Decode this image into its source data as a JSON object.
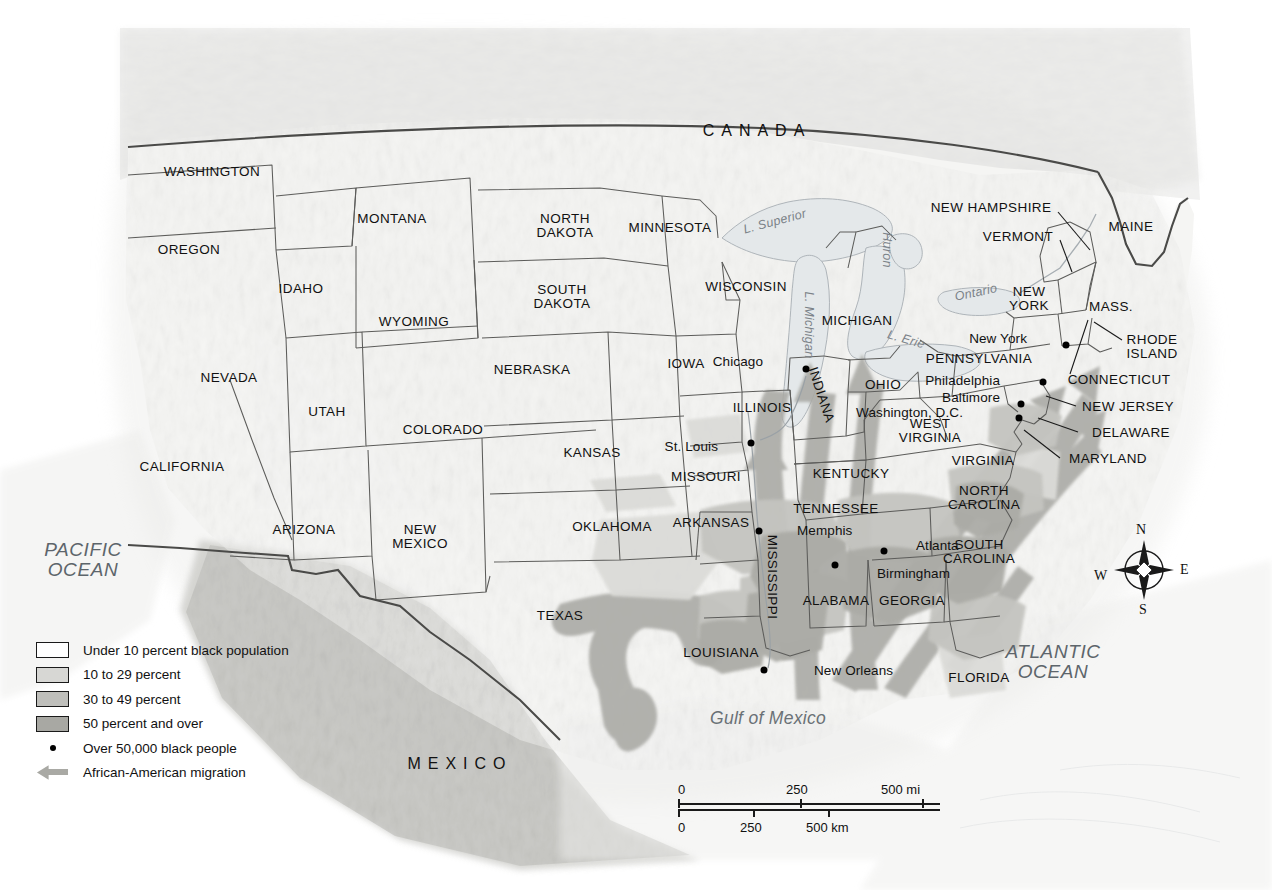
{
  "map": {
    "title_visible": false,
    "countries": [
      {
        "name": "CANADA",
        "x": 757,
        "y": 131
      },
      {
        "name": "MEXICO",
        "x": 460,
        "y": 764
      }
    ],
    "oceans": [
      {
        "name": "PACIFIC OCEAN",
        "lines": [
          "PACIFIC",
          "OCEAN"
        ],
        "x": 83,
        "y": 560
      },
      {
        "name": "ATLANTIC OCEAN",
        "lines": [
          "ATLANTIC",
          "OCEAN"
        ],
        "x": 1053,
        "y": 662
      }
    ],
    "water_bodies": [
      {
        "name": "Gulf of Mexico",
        "x": 768,
        "y": 718
      },
      {
        "name": "L. Superior",
        "x": 775,
        "y": 222
      },
      {
        "name": "Huron",
        "x": 886,
        "y": 250
      },
      {
        "name": "Ontario",
        "x": 976,
        "y": 293
      },
      {
        "name": "L. Erie",
        "x": 906,
        "y": 340
      },
      {
        "name": "L. Michigan",
        "x": 808,
        "y": 325
      }
    ],
    "states": [
      {
        "name": "WASHINGTON",
        "lines": [
          "WASHINGTON"
        ],
        "x": 212,
        "y": 172
      },
      {
        "name": "OREGON",
        "lines": [
          "OREGON"
        ],
        "x": 189,
        "y": 250
      },
      {
        "name": "IDAHO",
        "lines": [
          "IDAHO"
        ],
        "x": 301,
        "y": 289
      },
      {
        "name": "MONTANA",
        "lines": [
          "MONTANA"
        ],
        "x": 392,
        "y": 219
      },
      {
        "name": "WYOMING",
        "lines": [
          "WYOMING"
        ],
        "x": 414,
        "y": 322
      },
      {
        "name": "NEVADA",
        "lines": [
          "NEVADA"
        ],
        "x": 229,
        "y": 378
      },
      {
        "name": "UTAH",
        "lines": [
          "UTAH"
        ],
        "x": 327,
        "y": 412
      },
      {
        "name": "COLORADO",
        "lines": [
          "COLORADO"
        ],
        "x": 443,
        "y": 430
      },
      {
        "name": "CALIFORNIA",
        "lines": [
          "CALIFORNIA"
        ],
        "x": 182,
        "y": 467
      },
      {
        "name": "ARIZONA",
        "lines": [
          "ARIZONA"
        ],
        "x": 304,
        "y": 530
      },
      {
        "name": "NEW MEXICO",
        "lines": [
          "NEW",
          "MEXICO"
        ],
        "x": 420,
        "y": 537
      },
      {
        "name": "NORTH DAKOTA",
        "lines": [
          "NORTH",
          "DAKOTA"
        ],
        "x": 565,
        "y": 226
      },
      {
        "name": "SOUTH DAKOTA",
        "lines": [
          "SOUTH",
          "DAKOTA"
        ],
        "x": 562,
        "y": 297
      },
      {
        "name": "NEBRASKA",
        "lines": [
          "NEBRASKA"
        ],
        "x": 532,
        "y": 370
      },
      {
        "name": "KANSAS",
        "lines": [
          "KANSAS"
        ],
        "x": 592,
        "y": 453
      },
      {
        "name": "OKLAHOMA",
        "lines": [
          "OKLAHOMA"
        ],
        "x": 612,
        "y": 527
      },
      {
        "name": "TEXAS",
        "lines": [
          "TEXAS"
        ],
        "x": 560,
        "y": 616
      },
      {
        "name": "MINNESOTA",
        "lines": [
          "MINNESOTA"
        ],
        "x": 670,
        "y": 228
      },
      {
        "name": "IOWA",
        "lines": [
          "IOWA"
        ],
        "x": 686,
        "y": 364
      },
      {
        "name": "MISSOURI",
        "lines": [
          "MISSOURI"
        ],
        "x": 706,
        "y": 477
      },
      {
        "name": "ARKANSAS",
        "lines": [
          "ARKANSAS"
        ],
        "x": 711,
        "y": 523
      },
      {
        "name": "LOUISIANA",
        "lines": [
          "LOUISIANA"
        ],
        "x": 721,
        "y": 653
      },
      {
        "name": "WISCONSIN",
        "lines": [
          "WISCONSIN"
        ],
        "x": 746,
        "y": 287
      },
      {
        "name": "ILLINOIS",
        "lines": [
          "ILLINOIS"
        ],
        "x": 762,
        "y": 408
      },
      {
        "name": "MICHIGAN",
        "lines": [
          "MICHIGAN"
        ],
        "x": 857,
        "y": 321
      },
      {
        "name": "INDIANA",
        "lines": [
          "INDIANA"
        ],
        "x": 821,
        "y": 395,
        "rot": 72
      },
      {
        "name": "OHIO",
        "lines": [
          "OHIO"
        ],
        "x": 883,
        "y": 385
      },
      {
        "name": "KENTUCKY",
        "lines": [
          "KENTUCKY"
        ],
        "x": 851,
        "y": 474
      },
      {
        "name": "TENNESSEE",
        "lines": [
          "TENNESSEE"
        ],
        "x": 836,
        "y": 509
      },
      {
        "name": "MISSISSIPPI",
        "lines": [
          "MISSISSIPPI"
        ],
        "x": 772,
        "y": 577,
        "vertical": true
      },
      {
        "name": "ALABAMA",
        "lines": [
          "ALABAMA"
        ],
        "x": 836,
        "y": 601
      },
      {
        "name": "GEORGIA",
        "lines": [
          "GEORGIA"
        ],
        "x": 912,
        "y": 601
      },
      {
        "name": "FLORIDA",
        "lines": [
          "FLORIDA"
        ],
        "x": 979,
        "y": 678
      },
      {
        "name": "SOUTH CAROLINA",
        "lines": [
          "SOUTH",
          "CAROLINA"
        ],
        "x": 979,
        "y": 552
      },
      {
        "name": "NORTH CAROLINA",
        "lines": [
          "NORTH",
          "CAROLINA"
        ],
        "x": 984,
        "y": 498
      },
      {
        "name": "VIRGINIA",
        "lines": [
          "VIRGINIA"
        ],
        "x": 983,
        "y": 461
      },
      {
        "name": "WEST VIRGINIA",
        "lines": [
          "WEST",
          "VIRGINIA"
        ],
        "x": 930,
        "y": 431
      },
      {
        "name": "PENNSYLVANIA",
        "lines": [
          "PENNSYLVANIA"
        ],
        "x": 979,
        "y": 359
      },
      {
        "name": "NEW YORK",
        "lines": [
          "NEW",
          "YORK"
        ],
        "x": 1029,
        "y": 299
      },
      {
        "name": "MASS.",
        "lines": [
          "MASS."
        ],
        "x": 1111,
        "y": 307
      },
      {
        "name": "MAINE",
        "lines": [
          "MAINE"
        ],
        "x": 1131,
        "y": 227
      },
      {
        "name": "VERMONT",
        "lines": [
          "VERMONT"
        ],
        "x": 1018,
        "y": 237
      },
      {
        "name": "NEW HAMPSHIRE",
        "lines": [
          "NEW HAMPSHIRE"
        ],
        "x": 991,
        "y": 208
      },
      {
        "name": "RHODE ISLAND",
        "lines": [
          "RHODE",
          "ISLAND"
        ],
        "x": 1152,
        "y": 347
      },
      {
        "name": "CONNECTICUT",
        "lines": [
          "CONNECTICUT"
        ],
        "x": 1119,
        "y": 380
      },
      {
        "name": "NEW JERSEY",
        "lines": [
          "NEW JERSEY"
        ],
        "x": 1128,
        "y": 407
      },
      {
        "name": "DELAWARE",
        "lines": [
          "DELAWARE"
        ],
        "x": 1131,
        "y": 433
      },
      {
        "name": "MARYLAND",
        "lines": [
          "MARYLAND"
        ],
        "x": 1108,
        "y": 459
      }
    ],
    "cities": [
      {
        "name": "Chicago",
        "label_x": 763,
        "label_y": 362,
        "dot_x": 806,
        "dot_y": 369,
        "anchor": "right"
      },
      {
        "name": "St. Louis",
        "label_x": 718,
        "label_y": 447,
        "dot_x": 751,
        "dot_y": 443,
        "anchor": "right"
      },
      {
        "name": "Memphis",
        "label_x": 797,
        "label_y": 531,
        "dot_x": 759,
        "dot_y": 531,
        "anchor": "left"
      },
      {
        "name": "New Orleans",
        "label_x": 814,
        "label_y": 671,
        "dot_x": 764,
        "dot_y": 670,
        "anchor": "left"
      },
      {
        "name": "Birmingham",
        "label_x": 877,
        "label_y": 574,
        "dot_x": 835,
        "dot_y": 565,
        "anchor": "left"
      },
      {
        "name": "Atlanta",
        "label_x": 916,
        "label_y": 546,
        "dot_x": 884,
        "dot_y": 551,
        "anchor": "left"
      },
      {
        "name": "New York",
        "label_x": 1027,
        "label_y": 339,
        "dot_x": 1066,
        "dot_y": 345,
        "anchor": "right"
      },
      {
        "name": "Philadelphia",
        "label_x": 1000,
        "label_y": 381,
        "dot_x": 1043,
        "dot_y": 382,
        "anchor": "right"
      },
      {
        "name": "Baltimore",
        "label_x": 1000,
        "label_y": 398,
        "dot_x": 1021,
        "dot_y": 404,
        "anchor": "right"
      },
      {
        "name": "Washington, D.C.",
        "label_x": 963,
        "label_y": 413,
        "dot_x": 1019,
        "dot_y": 418,
        "anchor": "right"
      }
    ]
  },
  "legend": {
    "items": [
      {
        "label": "Under 10 percent black population",
        "type": "swatch",
        "color": "#ffffff"
      },
      {
        "label": "10 to 29 percent",
        "type": "swatch",
        "color": "#d7d7d4"
      },
      {
        "label": "30 to 49 percent",
        "type": "swatch",
        "color": "#bfbfbb"
      },
      {
        "label": "50 percent and over",
        "type": "swatch",
        "color": "#a8a8a3"
      },
      {
        "label": "Over 50,000 black people",
        "type": "dot",
        "color": "#000000"
      },
      {
        "label": "African-American migration",
        "type": "arrow",
        "color": "#a9a9a4"
      }
    ]
  },
  "scale": {
    "miles": {
      "ticks": [
        "0",
        "250",
        "500 mi"
      ],
      "unit": "mi"
    },
    "kilometers": {
      "ticks": [
        "0",
        "250",
        "500 km"
      ],
      "unit": "km"
    }
  },
  "compass": {
    "north": "N",
    "east": "E",
    "south": "S",
    "west": "W"
  },
  "colors": {
    "land": "#f4f4f2",
    "shade_10_29": "#d7d7d4",
    "shade_30_49": "#c2c2be",
    "shade_50_plus": "#a9a9a4",
    "water": "#e3e7e9",
    "border": "#5a5a58",
    "national_border": "#3a3a38",
    "arrow": "#a9a9a4",
    "text": "#111111"
  }
}
